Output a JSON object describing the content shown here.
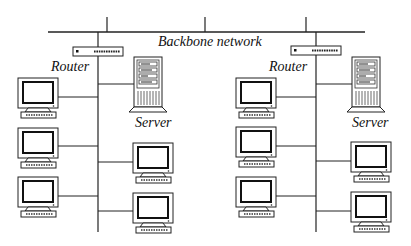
{
  "diagram": {
    "backbone_label": "Backbone network",
    "segments": [
      {
        "router_label": "Router",
        "server_label": "Server",
        "workstations_left": 3,
        "workstations_right": 2
      },
      {
        "router_label": "Router",
        "server_label": "Server",
        "workstations_left": 3,
        "workstations_right": 2
      }
    ]
  }
}
